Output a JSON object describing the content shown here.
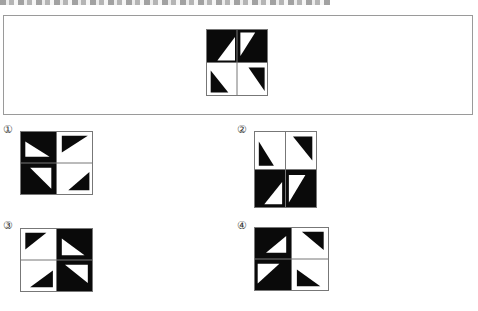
{
  "header": {
    "text_visible": false
  },
  "colors": {
    "black": "#0a0a0a",
    "white": "#ffffff",
    "grid_line": "#777777",
    "frame_border": "#9a9a9a"
  },
  "question_figure": {
    "cells": [
      {
        "pos": "top-left",
        "bg": "black",
        "triangle": "white",
        "points": [
          [
            0.35,
            1
          ],
          [
            1,
            1
          ],
          [
            1,
            0.2
          ]
        ]
      },
      {
        "pos": "top-right",
        "bg": "black",
        "triangle": "white",
        "points": [
          [
            0.05,
            0.05
          ],
          [
            0.6,
            0.05
          ],
          [
            0.05,
            0.85
          ]
        ]
      },
      {
        "pos": "bottom-left",
        "bg": "white",
        "triangle": "black",
        "points": [
          [
            0.1,
            0.2
          ],
          [
            0.1,
            0.95
          ],
          [
            0.75,
            0.95
          ]
        ]
      },
      {
        "pos": "bottom-right",
        "bg": "white",
        "triangle": "black",
        "points": [
          [
            0.35,
            0.1
          ],
          [
            0.95,
            0.1
          ],
          [
            0.95,
            0.9
          ]
        ]
      }
    ]
  },
  "options": [
    {
      "label": "①",
      "cells": [
        {
          "pos": "top-left",
          "bg": "black",
          "triangle": "white",
          "points": [
            [
              0.1,
              0.3
            ],
            [
              0.1,
              0.85
            ],
            [
              0.85,
              0.85
            ]
          ]
        },
        {
          "pos": "top-right",
          "bg": "white",
          "triangle": "black",
          "points": [
            [
              0.1,
              0.1
            ],
            [
              0.9,
              0.1
            ],
            [
              0.1,
              0.7
            ]
          ]
        },
        {
          "pos": "bottom-left",
          "bg": "black",
          "triangle": "white",
          "points": [
            [
              0.25,
              0.1
            ],
            [
              0.9,
              0.1
            ],
            [
              0.9,
              0.85
            ]
          ]
        },
        {
          "pos": "bottom-right",
          "bg": "white",
          "triangle": "black",
          "points": [
            [
              0.3,
              0.9
            ],
            [
              0.95,
              0.9
            ],
            [
              0.95,
              0.25
            ]
          ]
        }
      ]
    },
    {
      "label": "②",
      "cells": [
        {
          "pos": "top-left",
          "bg": "white",
          "triangle": "black",
          "points": [
            [
              0.1,
              0.25
            ],
            [
              0.1,
              0.95
            ],
            [
              0.65,
              0.95
            ]
          ]
        },
        {
          "pos": "top-right",
          "bg": "white",
          "triangle": "black",
          "points": [
            [
              0.2,
              0.1
            ],
            [
              0.9,
              0.1
            ],
            [
              0.9,
              0.8
            ]
          ]
        },
        {
          "pos": "bottom-left",
          "bg": "black",
          "triangle": "white",
          "points": [
            [
              0.3,
              0.95
            ],
            [
              0.95,
              0.95
            ],
            [
              0.95,
              0.3
            ]
          ]
        },
        {
          "pos": "bottom-right",
          "bg": "black",
          "triangle": "white",
          "points": [
            [
              0.05,
              0.1
            ],
            [
              0.65,
              0.1
            ],
            [
              0.05,
              0.9
            ]
          ]
        }
      ]
    },
    {
      "label": "③",
      "cells": [
        {
          "pos": "top-left",
          "bg": "white",
          "triangle": "black",
          "points": [
            [
              0.1,
              0.1
            ],
            [
              0.75,
              0.1
            ],
            [
              0.1,
              0.7
            ]
          ]
        },
        {
          "pos": "top-right",
          "bg": "black",
          "triangle": "white",
          "points": [
            [
              0.1,
              0.3
            ],
            [
              0.1,
              0.9
            ],
            [
              0.8,
              0.9
            ]
          ]
        },
        {
          "pos": "bottom-left",
          "bg": "white",
          "triangle": "black",
          "points": [
            [
              0.25,
              0.9
            ],
            [
              0.95,
              0.9
            ],
            [
              0.95,
              0.3
            ]
          ]
        },
        {
          "pos": "bottom-right",
          "bg": "black",
          "triangle": "white",
          "points": [
            [
              0.2,
              0.1
            ],
            [
              0.9,
              0.1
            ],
            [
              0.9,
              0.75
            ]
          ]
        }
      ]
    },
    {
      "label": "④",
      "cells": [
        {
          "pos": "top-left",
          "bg": "black",
          "triangle": "white",
          "points": [
            [
              0.3,
              0.85
            ],
            [
              0.9,
              0.85
            ],
            [
              0.9,
              0.25
            ]
          ]
        },
        {
          "pos": "top-right",
          "bg": "white",
          "triangle": "black",
          "points": [
            [
              0.25,
              0.1
            ],
            [
              0.9,
              0.1
            ],
            [
              0.9,
              0.75
            ]
          ]
        },
        {
          "pos": "bottom-left",
          "bg": "black",
          "triangle": "white",
          "points": [
            [
              0.05,
              0.1
            ],
            [
              0.7,
              0.1
            ],
            [
              0.05,
              0.8
            ]
          ]
        },
        {
          "pos": "bottom-right",
          "bg": "white",
          "triangle": "black",
          "points": [
            [
              0.1,
              0.3
            ],
            [
              0.1,
              0.9
            ],
            [
              0.8,
              0.9
            ]
          ]
        }
      ]
    }
  ]
}
